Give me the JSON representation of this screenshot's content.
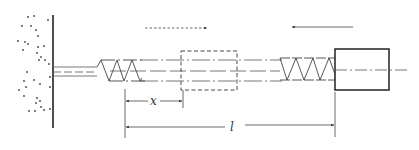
{
  "diagram": {
    "type": "spring-mass mechanical schematic",
    "colors": {
      "line": "#333333",
      "thin_line": "#555555",
      "background": "#ffffff"
    },
    "elements": {
      "wall": {
        "label": "fixed wall (hatched with dots)"
      },
      "rod": {
        "label": "guide rod"
      },
      "left_spring": {
        "label": "compressed spring (left)"
      },
      "dashed_block": {
        "label": "block reference position"
      },
      "right_spring": {
        "label": "spring (right)"
      },
      "block": {
        "label": "block"
      },
      "top_left_arrow": {
        "direction": "right",
        "style": "dotted"
      },
      "top_right_arrow": {
        "direction": "left",
        "style": "solid"
      }
    },
    "dimensions": {
      "x_label": "x",
      "l_label": "l"
    }
  }
}
